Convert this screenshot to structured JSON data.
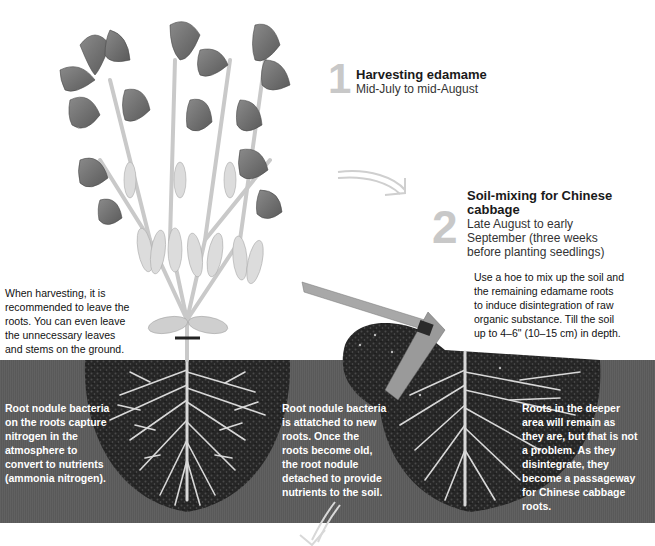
{
  "steps": [
    {
      "number": "1",
      "title": "Harvesting edamame",
      "subtitle": "Mid-July to mid-August"
    },
    {
      "number": "2",
      "title_line1": "Soil-mixing for Chinese",
      "title_line2": "cabbage",
      "subtitle_lines": [
        "Late August to early",
        "September (three weeks",
        "before planting seedlings)"
      ]
    }
  ],
  "notes": {
    "harvest_tip": [
      "When harvesting, it is",
      "recommended to leave the",
      "roots. You can even leave",
      "the unnecessary leaves",
      "and stems on the ground."
    ],
    "hoe_tip": [
      "Use a hoe to mix up the soil and",
      "the remaining edamame roots",
      "to induce disintegration of raw",
      "organic substance. Till the soil",
      "up to 4–6\" (10–15 cm) in depth."
    ],
    "nodule_capture": [
      "Root nodule bacteria",
      "on the roots capture",
      "nitrogen in the",
      "atmosphere to",
      "convert to nutrients",
      "(ammonia nitrogen)."
    ],
    "nodule_attach": [
      "Root nodule bacteria",
      "is attatched to new",
      "roots. Once the",
      "roots become old,",
      "the root nodule",
      "detached to provide",
      "nutrients to the soil."
    ],
    "deep_roots": [
      "Roots in the deeper",
      "area will remain as",
      "they are, but that is not",
      "a problem. As they",
      "disintegrate, they",
      "become a passageway",
      "for Chinese cabbage",
      "roots."
    ]
  },
  "colors": {
    "soil_band": "#5c5c5c",
    "soil_mound": "#2a2a2a",
    "step_number": "#c8c8c8",
    "leaf": "#6e6e6e",
    "stem": "#c9c9c9"
  }
}
